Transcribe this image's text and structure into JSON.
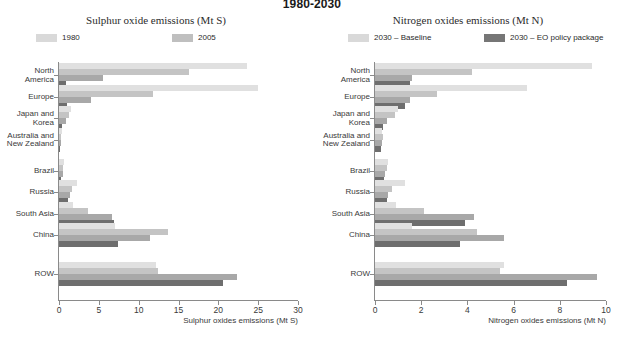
{
  "title": "1980-2030",
  "panels": [
    {
      "id": "sulphur",
      "title": "Sulphur oxide emissions (Mt S)",
      "legend": [
        {
          "label": "1980",
          "color": "#d9d9d9"
        },
        {
          "label": "2005",
          "color": "#bfbfbf"
        }
      ],
      "xlabel": "Sulphur oxides emissions (Mt S)"
    },
    {
      "id": "nitrogen",
      "title": "Nitrogen oxides emissions (Mt N)",
      "legend": [
        {
          "label": "2030 – Baseline",
          "color": "#d9d9d9"
        },
        {
          "label": "2030 – EO policy package",
          "color": "#767676"
        }
      ],
      "xlabel": "Nitrogen oxides emissions (Mt N)"
    }
  ],
  "chart_data": [
    {
      "type": "bar",
      "orientation": "horizontal",
      "title": "Sulphur oxide emissions (Mt S)",
      "xlabel": "Sulphur oxides emissions (Mt S)",
      "ylabel": "",
      "xlim": [
        0,
        30
      ],
      "xticks": [
        0,
        5,
        10,
        15,
        20,
        25,
        30
      ],
      "grid": false,
      "legend_position": "top",
      "categories": [
        "North America",
        "Europe",
        "Japan and Korea",
        "Australia and New Zealand",
        "Brazil",
        "Russia",
        "South Asia",
        "China",
        "ROW"
      ],
      "series": [
        {
          "name": "1980",
          "color": "#e0e0e0",
          "values": [
            23.6,
            25.0,
            1.5,
            0.35,
            0.6,
            2.2,
            1.7,
            7.0,
            12.2
          ]
        },
        {
          "name": "2005",
          "color": "#c4c4c4",
          "values": [
            16.3,
            11.8,
            1.3,
            0.25,
            0.5,
            1.6,
            3.6,
            13.7,
            12.4
          ]
        },
        {
          "name": "2030 – Baseline",
          "color": "#a8a8a8",
          "values": [
            5.5,
            4.0,
            0.9,
            0.2,
            0.45,
            1.4,
            6.6,
            11.4,
            22.4
          ]
        },
        {
          "name": "2030 – EO policy package",
          "color": "#6e6e6e",
          "values": [
            0.9,
            1.0,
            0.35,
            0.15,
            0.3,
            1.1,
            6.9,
            7.4,
            20.6
          ]
        }
      ]
    },
    {
      "type": "bar",
      "orientation": "horizontal",
      "title": "Nitrogen oxides emissions (Mt N)",
      "xlabel": "Nitrogen oxides emissions (Mt N)",
      "ylabel": "",
      "xlim": [
        0,
        10
      ],
      "xticks": [
        0,
        2,
        4,
        6,
        8,
        10
      ],
      "grid": false,
      "legend_position": "top",
      "categories": [
        "North America",
        "Europe",
        "Japan and Korea",
        "Australia and New Zealand",
        "Brazil",
        "Russia",
        "South Asia",
        "China",
        "ROW"
      ],
      "series": [
        {
          "name": "1980",
          "color": "#e0e0e0",
          "values": [
            9.4,
            6.6,
            1.0,
            0.3,
            0.55,
            1.3,
            0.9,
            1.6,
            5.6
          ]
        },
        {
          "name": "2005",
          "color": "#c4c4c4",
          "values": [
            4.2,
            2.7,
            0.85,
            0.35,
            0.5,
            0.75,
            2.1,
            4.4,
            5.4
          ]
        },
        {
          "name": "2030 – Baseline",
          "color": "#a8a8a8",
          "values": [
            1.6,
            1.5,
            0.5,
            0.3,
            0.45,
            0.55,
            4.3,
            5.6,
            9.6
          ]
        },
        {
          "name": "2030 – EO policy package",
          "color": "#6e6e6e",
          "values": [
            1.5,
            1.3,
            0.35,
            0.25,
            0.4,
            0.5,
            3.9,
            3.7,
            8.3
          ]
        }
      ]
    }
  ]
}
